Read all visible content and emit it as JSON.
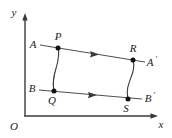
{
  "figure": {
    "background_color": "#ffffff",
    "stroke_color": "#3a3a3a",
    "text_color": "#1a1a1a",
    "axes": {
      "origin_label": "O",
      "x_axis_label": "x",
      "y_axis_label": "y",
      "origin": {
        "x": 25,
        "y": 116
      },
      "x_axis_end": {
        "x": 158,
        "y": 116
      },
      "y_axis_end": {
        "x": 25,
        "y": 14
      }
    },
    "points": [
      {
        "name": "P",
        "label": "P",
        "x": 58,
        "y": 48,
        "dot": true
      },
      {
        "name": "Q",
        "label": "Q",
        "x": 54,
        "y": 91,
        "dot": true
      },
      {
        "name": "R",
        "label": "R",
        "x": 133,
        "y": 60,
        "dot": true
      },
      {
        "name": "S",
        "label": "S",
        "x": 128,
        "y": 99,
        "dot": true
      }
    ],
    "endpoint_labels": [
      {
        "name": "A",
        "label": "A",
        "x": 31,
        "y": 47
      },
      {
        "name": "A-prime",
        "label": "A",
        "prime": "′",
        "x": 146,
        "y": 65
      },
      {
        "name": "B",
        "label": "B",
        "x": 29,
        "y": 91
      },
      {
        "name": "B-prime",
        "label": "B",
        "prime": "′",
        "x": 143,
        "y": 101
      }
    ],
    "point_labels": [
      {
        "name": "P",
        "label": "P",
        "x": 57,
        "y": 39
      },
      {
        "name": "Q",
        "label": "Q",
        "x": 51,
        "y": 103
      },
      {
        "name": "R",
        "label": "R",
        "x": 131,
        "y": 51
      },
      {
        "name": "S",
        "label": "S",
        "x": 124,
        "y": 111
      }
    ],
    "lines": [
      {
        "name": "line-A-to-Aprime",
        "from": {
          "x": 40,
          "y": 45
        },
        "to": {
          "x": 145,
          "y": 62
        },
        "arrow_marker_at": {
          "x": 93,
          "y": 53.5
        }
      },
      {
        "name": "line-B-to-Bprime",
        "from": {
          "x": 39,
          "y": 90
        },
        "to": {
          "x": 142,
          "y": 99
        },
        "arrow_marker_at": {
          "x": 91,
          "y": 94.5
        }
      }
    ],
    "curves": [
      {
        "name": "curve-PQ",
        "path": "M 58 48 C 62 62, 50 74, 54 91"
      },
      {
        "name": "curve-RS",
        "path": "M 133 60 C 137 74, 124 83, 128 99"
      }
    ]
  }
}
